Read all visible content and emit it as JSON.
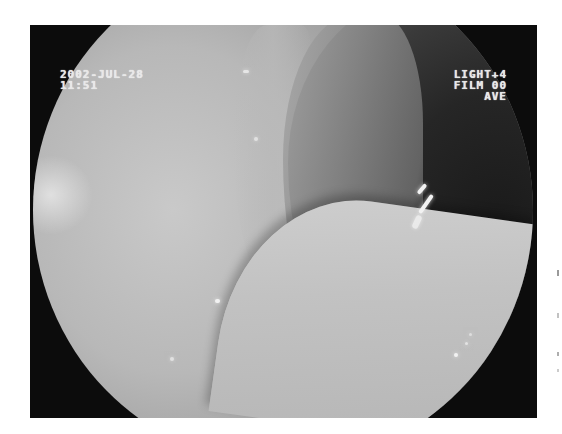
{
  "image": {
    "type": "endoscopy-frame",
    "frame_color": "#0c0c0c",
    "background_color": "#ffffff"
  },
  "overlay": {
    "left": {
      "date": "2002-JUL-28",
      "time": "11:51"
    },
    "right": {
      "light": "LIGHT+4",
      "film": "FILM 00",
      "mode": "AVE"
    },
    "text_color": "#e8e8e8"
  }
}
